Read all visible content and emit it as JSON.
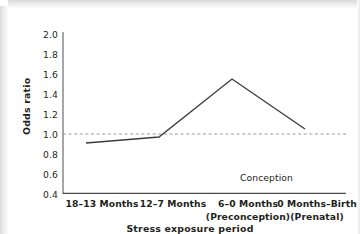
{
  "chart_data": {
    "type": "line",
    "title": "",
    "xlabel": "Stress exposure period",
    "ylabel": "Odds ratio",
    "categories": [
      "18–13 Months",
      "12–7 Months",
      "6–0 Months",
      "0 Months–Birth"
    ],
    "category_sublabels": [
      "",
      "",
      "(Preconception)",
      "(Prenatal)"
    ],
    "values": [
      0.91,
      0.97,
      1.55,
      1.05
    ],
    "series": [
      {
        "name": "Odds ratio",
        "values": [
          0.91,
          0.97,
          1.55,
          1.05
        ]
      }
    ],
    "ylim": [
      0.4,
      2.0
    ],
    "ytick_labels": [
      "2.0",
      "1.8",
      "1.6",
      "1.4",
      "1.2",
      "1.0",
      "0.8",
      "0.6",
      "0.4"
    ],
    "ytick_values": [
      2.0,
      1.8,
      1.6,
      1.4,
      1.2,
      1.0,
      0.8,
      0.6,
      0.4
    ],
    "grid": false,
    "legend": "none",
    "reference_line": {
      "value": 1.0,
      "style": "dashed",
      "color": "#9a9a9a"
    },
    "annotations": [
      {
        "text": "Conception",
        "x_category_index": 2.55,
        "y": 0.57
      }
    ],
    "line_color": "#3c3c3c",
    "text_color": "#231f20"
  },
  "axis": {
    "y_title": "Odds ratio",
    "x_title": "Stress exposure period",
    "ytick_0": "2.0",
    "ytick_1": "1.8",
    "ytick_2": "1.6",
    "ytick_3": "1.4",
    "ytick_4": "1.2",
    "ytick_5": "1.0",
    "ytick_6": "0.8",
    "ytick_7": "0.6",
    "ytick_8": "0.4",
    "xtick_0": "18–13 Months",
    "xtick_1": "12–7 Months",
    "xtick_2a": "6–0 Months",
    "xtick_2b": "(Preconception)",
    "xtick_3a": "0 Months–Birth",
    "xtick_3b": "(Prenatal)"
  },
  "annotation": {
    "conception": "Conception"
  }
}
